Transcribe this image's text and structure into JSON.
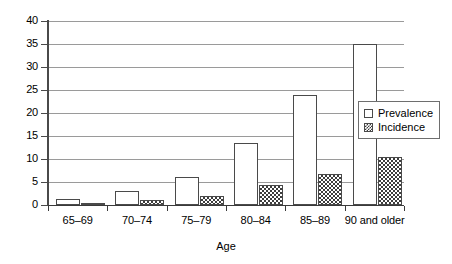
{
  "chart_data": {
    "type": "bar",
    "title": "",
    "subtitle": "",
    "xlabel": "Age",
    "ylabel": "",
    "categories": [
      "65–69",
      "70–74",
      "75–79",
      "80–84",
      "85–89",
      "90 and older"
    ],
    "series": [
      {
        "name": "Prevalence",
        "values": [
          1.3,
          3,
          6,
          13.5,
          24,
          35
        ]
      },
      {
        "name": "Incidence",
        "values": [
          0.3,
          1,
          2,
          4.3,
          6.7,
          10.5
        ]
      }
    ],
    "ylim": [
      0,
      40
    ],
    "ytick_values": [
      0,
      5,
      10,
      15,
      20,
      25,
      30,
      35,
      40
    ],
    "ytick_labels": [
      "0",
      "5",
      "10",
      "15",
      "20",
      "25",
      "30",
      "35",
      "40"
    ],
    "grid": true,
    "grid_axis": "y",
    "legend_position": "right-inside",
    "legend_entries": [
      "Prevalence",
      "Incidence"
    ],
    "colors": {
      "prevalence": "#ffffff",
      "incidence": "#3d3d3d",
      "axis": "#3a3a3a",
      "grid": "#9a9a9a",
      "text": "#000000"
    }
  }
}
